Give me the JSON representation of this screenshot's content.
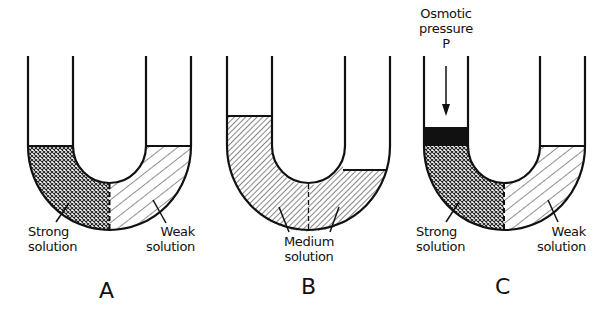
{
  "figure": {
    "panels": [
      {
        "id": "A",
        "letter": "A",
        "left_label": {
          "line1": "Strong",
          "line2": "solution"
        },
        "right_label": {
          "line1": "Weak",
          "line2": "solution"
        }
      },
      {
        "id": "B",
        "letter": "B",
        "center_label": {
          "line1": "Medium",
          "line2": "solution"
        }
      },
      {
        "id": "C",
        "letter": "C",
        "top_label": {
          "line1": "Osmotic",
          "line2": "pressure",
          "line3": "P"
        },
        "left_label": {
          "line1": "Strong",
          "line2": "solution"
        },
        "right_label": {
          "line1": "Weak",
          "line2": "solution"
        }
      }
    ],
    "colors": {
      "ink": "#111111",
      "background": "#ffffff"
    }
  }
}
